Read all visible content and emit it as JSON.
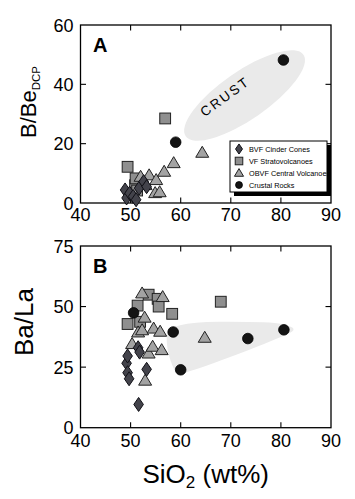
{
  "figure": {
    "background": "#ffffff",
    "x_axis_title": {
      "prefix": "SiO",
      "sub": "2",
      "suffix": " (wt%)"
    },
    "colors": {
      "frame": "#000000",
      "square_fill": "#8f8f8f",
      "triangle_fill": "#a3a3a3",
      "diamond_fill": "#43434b",
      "circle_fill": "#141414",
      "marker_stroke": "#222222",
      "shade_fill": "#eaeaea",
      "annotation_text": "#3f3f3f",
      "legend_shadow": "#000000"
    },
    "legend": {
      "items": [
        {
          "marker": "diamond",
          "label": "BVF Cinder Cones"
        },
        {
          "marker": "square",
          "label": "VF Stratovolcanoes"
        },
        {
          "marker": "triangle",
          "label": "OBVF Central Volcanoes"
        },
        {
          "marker": "circle",
          "label": "Crustal Rocks"
        }
      ]
    }
  },
  "chart_data": [
    {
      "id": "A",
      "type": "scatter",
      "panel_label": "A",
      "ylabel_main": "B/Be",
      "ylabel_sub": "DCP",
      "xlim": [
        40,
        90
      ],
      "ylim": [
        0,
        60
      ],
      "xticks": [
        40,
        50,
        60,
        70,
        80,
        90
      ],
      "yticks": [
        0,
        20,
        40,
        60
      ],
      "grid": false,
      "series": [
        {
          "name": "VF Stratovolcanoes",
          "marker": "square",
          "points": [
            [
              49.4,
              12.2
            ],
            [
              50.9,
              6.0
            ],
            [
              51.0,
              8.3
            ],
            [
              51.3,
              4.2
            ],
            [
              56.9,
              28.5
            ]
          ]
        },
        {
          "name": "OBVF Central Volcanoes",
          "marker": "triangle",
          "points": [
            [
              52.0,
              8.9
            ],
            [
              53.0,
              6.1
            ],
            [
              53.7,
              9.4
            ],
            [
              54.9,
              3.4
            ],
            [
              55.1,
              7.8
            ],
            [
              55.8,
              3.7
            ],
            [
              56.7,
              10.6
            ],
            [
              58.6,
              13.5
            ],
            [
              64.3,
              17.0
            ]
          ]
        },
        {
          "name": "BVF Cinder Cones",
          "marker": "diamond",
          "points": [
            [
              48.9,
              4.4
            ],
            [
              49.2,
              1.7
            ],
            [
              49.8,
              3.3
            ],
            [
              50.5,
              2.2
            ],
            [
              51.1,
              1.1
            ],
            [
              51.7,
              5.0
            ],
            [
              52.6,
              7.2
            ],
            [
              53.2,
              5.5
            ]
          ]
        },
        {
          "name": "Crustal Rocks",
          "marker": "circle",
          "points": [
            [
              59.0,
              20.5
            ],
            [
              80.5,
              48.2
            ]
          ]
        }
      ],
      "annotation": {
        "label": "CRUST",
        "major_axis": [
          [
            61.0,
            22.5
          ],
          [
            84.5,
            50.0
          ]
        ],
        "half_width_px": 24,
        "label_pos": [
          69.4,
          34.6
        ],
        "label_angle_deg": -36
      }
    },
    {
      "id": "B",
      "type": "scatter",
      "panel_label": "B",
      "ylabel_main": "Ba/La",
      "ylabel_sub": "",
      "xlim": [
        40,
        90
      ],
      "ylim": [
        0,
        75
      ],
      "xticks": [
        40,
        50,
        60,
        70,
        80,
        90
      ],
      "yticks": [
        0,
        25,
        50,
        75
      ],
      "grid": false,
      "series": [
        {
          "name": "VF Stratovolcanoes",
          "marker": "square",
          "points": [
            [
              49.4,
              42.8
            ],
            [
              51.4,
              50.4
            ],
            [
              51.9,
              43.7
            ],
            [
              53.6,
              54.9
            ],
            [
              55.4,
              53.2
            ],
            [
              55.6,
              50.0
            ],
            [
              58.3,
              47.0
            ],
            [
              68.0,
              52.0
            ]
          ]
        },
        {
          "name": "OBVF Central Volcanoes",
          "marker": "triangle",
          "points": [
            [
              50.3,
              34.6
            ],
            [
              51.5,
              39.4
            ],
            [
              52.3,
              40.3
            ],
            [
              52.3,
              55.5
            ],
            [
              52.8,
              45.5
            ],
            [
              52.9,
              19.5
            ],
            [
              53.6,
              30.7
            ],
            [
              54.4,
              33.5
            ],
            [
              54.6,
              41.0
            ],
            [
              55.9,
              39.7
            ],
            [
              56.2,
              32.1
            ],
            [
              56.4,
              54.0
            ],
            [
              64.8,
              37.2
            ]
          ]
        },
        {
          "name": "BVF Cinder Cones",
          "marker": "diamond",
          "points": [
            [
              49.2,
              26.6
            ],
            [
              49.4,
              22.7
            ],
            [
              49.4,
              29.6
            ],
            [
              49.7,
              20.2
            ],
            [
              51.5,
              33.0
            ],
            [
              51.8,
              31.2
            ],
            [
              53.2,
              24.1
            ],
            [
              51.6,
              9.6
            ]
          ]
        },
        {
          "name": "Crustal Rocks",
          "marker": "circle",
          "points": [
            [
              50.6,
              47.4
            ],
            [
              58.5,
              39.5
            ],
            [
              60.0,
              23.9
            ],
            [
              73.4,
              36.8
            ],
            [
              80.6,
              40.4
            ]
          ]
        }
      ],
      "shade_polygon": [
        [
          57.3,
          43.6
        ],
        [
          78.0,
          43.8
        ],
        [
          82.3,
          41.8
        ],
        [
          82.7,
          39.9
        ],
        [
          80.0,
          37.4
        ],
        [
          73.0,
          31.5
        ],
        [
          60.3,
          22.0
        ],
        [
          58.8,
          22.6
        ],
        [
          57.1,
          33.0
        ]
      ]
    }
  ]
}
